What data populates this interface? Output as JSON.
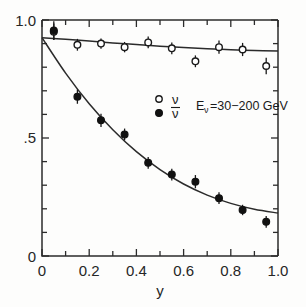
{
  "chart_data": {
    "type": "scatter",
    "title": "",
    "xlabel": "y",
    "ylabel": "",
    "xlim": [
      0,
      1.0
    ],
    "ylim": [
      0,
      1.0
    ],
    "grid": false,
    "legend_position": "center",
    "x_ticks_major": [
      "0",
      "0.2",
      "0.4",
      "0.6",
      "0.8",
      "1.0"
    ],
    "x_tick_values": [
      0,
      0.2,
      0.4,
      0.6,
      0.8,
      1.0
    ],
    "x_minor_tick_values": [
      0.1,
      0.3,
      0.5,
      0.7,
      0.9
    ],
    "y_ticks_major": [
      "0",
      ".5",
      "1.0"
    ],
    "y_tick_values": [
      0,
      0.5,
      1.0
    ],
    "y_minor_tick_values": [
      0.1,
      0.2,
      0.3,
      0.4,
      0.6,
      0.7,
      0.8,
      0.9
    ],
    "annotation": "Eν=30−200 GeV",
    "series": [
      {
        "name": "ν",
        "marker": "open-circle",
        "x": [
          0.05,
          0.15,
          0.25,
          0.35,
          0.45,
          0.55,
          0.65,
          0.75,
          0.85,
          0.95
        ],
        "values": [
          0.95,
          0.895,
          0.9,
          0.885,
          0.905,
          0.88,
          0.825,
          0.885,
          0.875,
          0.805
        ],
        "yerr": [
          0.035,
          0.025,
          0.022,
          0.022,
          0.025,
          0.025,
          0.025,
          0.028,
          0.028,
          0.035
        ]
      },
      {
        "name": "ν̅",
        "marker": "filled-circle",
        "x": [
          0.05,
          0.15,
          0.25,
          0.35,
          0.45,
          0.55,
          0.65,
          0.75,
          0.85,
          0.95
        ],
        "values": [
          0.955,
          0.675,
          0.575,
          0.515,
          0.395,
          0.345,
          0.315,
          0.245,
          0.195,
          0.145
        ],
        "yerr": [
          0.04,
          0.03,
          0.028,
          0.025,
          0.025,
          0.025,
          0.028,
          0.025,
          0.022,
          0.025
        ]
      }
    ],
    "fit_curves": [
      {
        "name": "ν-fit",
        "x": [
          0.0,
          0.1,
          0.2,
          0.3,
          0.4,
          0.5,
          0.6,
          0.7,
          0.8,
          0.9,
          1.0
        ],
        "y": [
          0.925,
          0.918,
          0.911,
          0.903,
          0.896,
          0.889,
          0.883,
          0.878,
          0.874,
          0.871,
          0.869
        ]
      },
      {
        "name": "ν̅-fit",
        "x": [
          0.0,
          0.1,
          0.2,
          0.3,
          0.4,
          0.5,
          0.6,
          0.7,
          0.8,
          0.9,
          1.0
        ],
        "y": [
          0.925,
          0.775,
          0.645,
          0.535,
          0.442,
          0.366,
          0.305,
          0.258,
          0.223,
          0.198,
          0.182
        ]
      }
    ]
  },
  "legend": {
    "entry_nu_symbol": "ν",
    "entry_nubar_symbol": "ν",
    "energy_label": "E",
    "energy_sub": "ν",
    "energy_value": "=30−200 GeV"
  },
  "axes": {
    "x_title": "y",
    "y_label_top": "1.0",
    "y_label_mid": ".5",
    "y_label_bottom": "0",
    "x_label_0": "0",
    "x_label_1": "0.2",
    "x_label_2": "0.4",
    "x_label_3": "0.6",
    "x_label_4": "0.8",
    "x_label_5": "1.0"
  },
  "colors": {
    "ink": "#2b2b2b",
    "background": "#fdfdfc",
    "marker_fill_open": "#ffffff",
    "marker_fill_closed": "#111111"
  }
}
